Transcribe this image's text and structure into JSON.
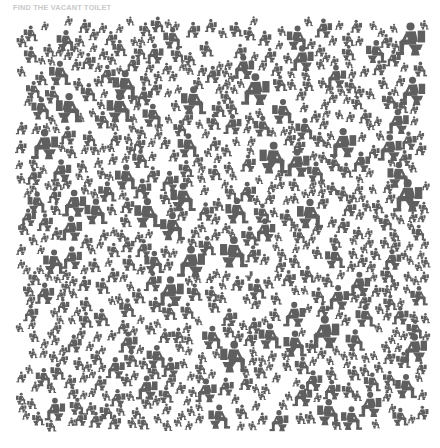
{
  "title": "FIND THE VACANT TOILET",
  "colors": {
    "background": "#ffffff",
    "figure": "#5f5f5f",
    "title": "#c9c9c9"
  },
  "puzzle": {
    "description": "Dense field of gray pictograms of people seated on toilets; one toilet is vacant",
    "area": {
      "x": 14,
      "y": 16,
      "width": 418,
      "height": 416
    },
    "figure_icon": "person-on-toilet-icon",
    "vacant_icon": "vacant-toilet-icon",
    "figure_count": 720,
    "size_min": 9,
    "size_max": 34,
    "seed": 73,
    "vacant_toilet": {
      "x": 241,
      "y": 268,
      "size": 13
    }
  }
}
